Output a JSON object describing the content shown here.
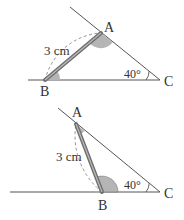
{
  "figures": [
    {
      "id": "top",
      "points": {
        "A": "A",
        "B": "B",
        "C": "C"
      },
      "length_label": "3 cm",
      "angle_label": "40°"
    },
    {
      "id": "bottom",
      "points": {
        "A": "A",
        "B": "B",
        "C": "C"
      },
      "length_label": "3 cm",
      "angle_label": "40°"
    }
  ],
  "colors": {
    "line": "#555555",
    "rod": "#8a8a8a",
    "angle_fill": "#b5b5b5",
    "dashed": "#888888"
  }
}
